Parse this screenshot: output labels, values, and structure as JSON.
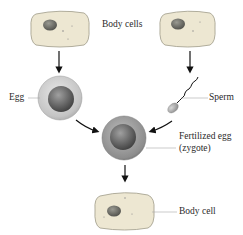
{
  "labels": {
    "body_cells": "Body cells",
    "egg": "Egg",
    "sperm": "Sperm",
    "zygote_line1": "Fertilized egg",
    "zygote_line2": "(zygote)",
    "body_cell": "Body cell"
  },
  "colors": {
    "cell_fill": "#ece6cf",
    "cell_border": "#9e9a88",
    "nucleus": "#6e6d66",
    "egg_outer": "#cfcfcf",
    "egg_inner": "#6a6a6a",
    "arrow": "#111111",
    "label_line": "#aaaaaa"
  },
  "nodes": [
    {
      "id": "body-cell-left",
      "type": "body-cell"
    },
    {
      "id": "body-cell-right",
      "type": "body-cell"
    },
    {
      "id": "egg",
      "type": "egg"
    },
    {
      "id": "sperm",
      "type": "sperm"
    },
    {
      "id": "zygote",
      "type": "zygote"
    },
    {
      "id": "body-cell-bottom",
      "type": "body-cell"
    }
  ],
  "edges": [
    {
      "from": "body-cell-left",
      "to": "egg"
    },
    {
      "from": "body-cell-right",
      "to": "sperm"
    },
    {
      "from": "egg",
      "to": "zygote"
    },
    {
      "from": "sperm",
      "to": "zygote"
    },
    {
      "from": "zygote",
      "to": "body-cell-bottom"
    }
  ]
}
